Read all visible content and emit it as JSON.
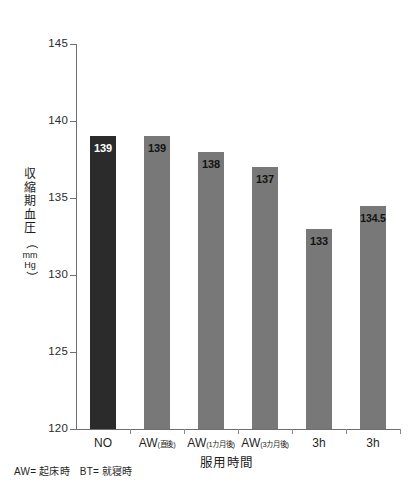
{
  "chart_data": {
    "type": "bar",
    "title": "",
    "xlabel": "服用時間",
    "ylabel": "収縮期血圧（mmHg）",
    "ylim": [
      120,
      145
    ],
    "ytick_labels": [
      "145",
      "140",
      "135",
      "130",
      "125",
      "120"
    ],
    "ytick_values": [
      145,
      140,
      135,
      130,
      125,
      120
    ],
    "grid": false,
    "legend": "none",
    "categories": [
      "NO",
      "AW(直後)",
      "AW(1カ月後)",
      "AW(3カ月後)",
      "3h",
      "3h"
    ],
    "category_parts": [
      {
        "main": "NO",
        "sub": ""
      },
      {
        "main": "AW",
        "sub": "(直後)"
      },
      {
        "main": "AW",
        "sub": "(1カ月後)"
      },
      {
        "main": "AW",
        "sub": "(3カ月後)"
      },
      {
        "main": "3h",
        "sub": ""
      },
      {
        "main": "3h",
        "sub": ""
      }
    ],
    "values": [
      139,
      139,
      138,
      137,
      133,
      134.5
    ],
    "value_labels": [
      "139",
      "139",
      "138",
      "137",
      "133",
      "134.5"
    ],
    "bar_colors": [
      "#2b2b2b",
      "#787878",
      "#787878",
      "#787878",
      "#787878",
      "#787878"
    ],
    "label_colors": [
      "#ffffff",
      "#131313",
      "#131313",
      "#131313",
      "#131313",
      "#131313"
    ]
  },
  "yaxis": {
    "title_chars": [
      "収",
      "縮",
      "期",
      "血",
      "圧"
    ],
    "unit_open": "（",
    "unit_mm": "mm",
    "unit_hg": "Hg",
    "unit_close": "）"
  },
  "footnote": {
    "aw": "AW= 起床時",
    "bt": "BT= 就寝時"
  }
}
